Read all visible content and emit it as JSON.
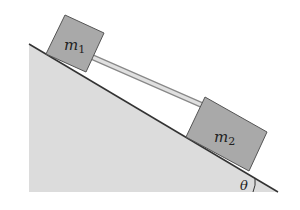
{
  "diagram": {
    "blocks": [
      {
        "id": "m1",
        "label": "m",
        "subscript": "1"
      },
      {
        "id": "m2",
        "label": "m",
        "subscript": "2"
      }
    ],
    "angle_label": "θ",
    "colors": {
      "incline_fill": "#dcdcdc",
      "incline_edge": "#333333",
      "block_fill": "#a9a9a9",
      "block_edge": "#555555",
      "rod": "#c8c8c8"
    }
  }
}
